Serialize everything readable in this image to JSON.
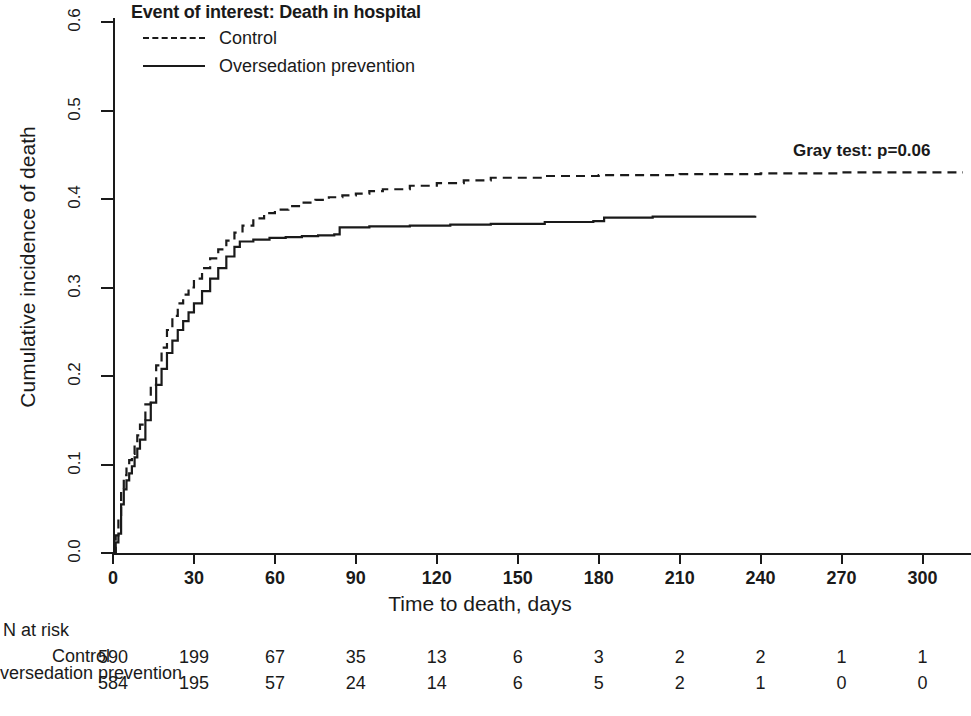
{
  "legend": {
    "title": "Event of interest: Death in hospital",
    "entries": [
      {
        "label": "Control",
        "style": "dashed"
      },
      {
        "label": "Oversedation prevention",
        "style": "solid"
      }
    ]
  },
  "annotation": {
    "gray_test": "Gray test: p=0.06"
  },
  "axes": {
    "ylabel": "Cumulative incidence of death",
    "xlabel": "Time to death, days",
    "yticks": [
      "0.0",
      "0.1",
      "0.2",
      "0.3",
      "0.4",
      "0.5",
      "0.6"
    ],
    "xticks": [
      "0",
      "30",
      "60",
      "90",
      "120",
      "150",
      "180",
      "210",
      "240",
      "270",
      "300"
    ]
  },
  "risk_table": {
    "title": "N at risk",
    "row_labels": [
      "Control",
      "Oversedation prevention"
    ],
    "rows": [
      [
        590,
        199,
        67,
        35,
        13,
        6,
        3,
        2,
        2,
        1,
        1
      ],
      [
        584,
        195,
        57,
        24,
        14,
        6,
        5,
        2,
        1,
        0,
        0
      ]
    ]
  },
  "chart_data": {
    "type": "line",
    "title": "Event of interest: Death in hospital",
    "xlabel": "Time to death, days",
    "ylabel": "Cumulative incidence of death",
    "xlim": [
      0,
      315
    ],
    "ylim": [
      0.0,
      0.6
    ],
    "grid": false,
    "legend_position": "top-left",
    "annotations": [
      {
        "text": "Gray test: p=0.06",
        "x": 285,
        "y": 0.455
      }
    ],
    "series": [
      {
        "name": "Control",
        "style": "dashed",
        "color": "#1a1a1a",
        "x": [
          0,
          1,
          2,
          3,
          4,
          5,
          6,
          7,
          8,
          9,
          10,
          12,
          14,
          16,
          18,
          20,
          22,
          24,
          26,
          28,
          30,
          33,
          36,
          39,
          42,
          45,
          48,
          52,
          56,
          60,
          65,
          70,
          75,
          80,
          85,
          90,
          95,
          100,
          110,
          120,
          130,
          140,
          160,
          180,
          210,
          240,
          270,
          300,
          315
        ],
        "y": [
          0.0,
          0.02,
          0.04,
          0.07,
          0.088,
          0.098,
          0.105,
          0.112,
          0.122,
          0.133,
          0.145,
          0.168,
          0.19,
          0.212,
          0.232,
          0.252,
          0.268,
          0.282,
          0.292,
          0.3,
          0.31,
          0.322,
          0.333,
          0.343,
          0.353,
          0.362,
          0.37,
          0.378,
          0.384,
          0.388,
          0.392,
          0.396,
          0.399,
          0.402,
          0.404,
          0.406,
          0.409,
          0.411,
          0.415,
          0.418,
          0.421,
          0.424,
          0.426,
          0.427,
          0.428,
          0.429,
          0.43,
          0.43,
          0.43
        ]
      },
      {
        "name": "Oversedation prevention",
        "style": "solid",
        "color": "#1a1a1a",
        "x": [
          0,
          1,
          2,
          3,
          4,
          5,
          6,
          7,
          8,
          9,
          10,
          12,
          14,
          16,
          18,
          20,
          22,
          24,
          26,
          28,
          30,
          33,
          36,
          39,
          42,
          45,
          47,
          52,
          58,
          64,
          70,
          76,
          82,
          84,
          95,
          110,
          125,
          140,
          160,
          178,
          182,
          200,
          220,
          238
        ],
        "y": [
          0.0,
          0.012,
          0.022,
          0.055,
          0.072,
          0.082,
          0.09,
          0.098,
          0.108,
          0.118,
          0.128,
          0.15,
          0.17,
          0.19,
          0.208,
          0.226,
          0.24,
          0.252,
          0.262,
          0.272,
          0.282,
          0.296,
          0.31,
          0.322,
          0.335,
          0.346,
          0.352,
          0.354,
          0.356,
          0.357,
          0.358,
          0.359,
          0.36,
          0.368,
          0.369,
          0.37,
          0.371,
          0.372,
          0.374,
          0.375,
          0.379,
          0.38,
          0.38,
          0.381
        ]
      }
    ]
  }
}
